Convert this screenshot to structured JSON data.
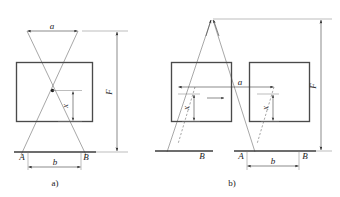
{
  "figure": {
    "background_color": "#ffffff",
    "line_color": "#4a4a4a",
    "ray_color": "#6b6b6b",
    "text_color": "#1a1a1a",
    "panels": [
      {
        "id": "a",
        "caption": "a)",
        "labels": {
          "top_dim": "a",
          "vertical_dim": "F",
          "inner_dim": "x",
          "base_left": "A",
          "base_right": "B",
          "base_dim": "b"
        }
      },
      {
        "id": "b",
        "caption": "b)",
        "labels": {
          "top_dim": "a",
          "vertical_dim": "F",
          "inner_dim_left": "x",
          "inner_dim_right": "x",
          "base_left_1": "A",
          "base_right_1": "B",
          "base_left_2": "A",
          "base_right_2": "B",
          "base_dim": "b"
        }
      }
    ]
  }
}
